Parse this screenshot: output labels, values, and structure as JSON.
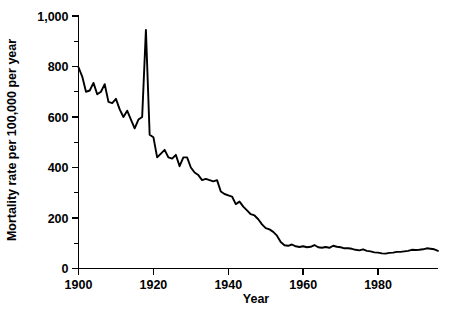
{
  "chart_data": {
    "type": "line",
    "title": "",
    "xlabel": "Year",
    "ylabel": "Mortality rate per 100,000 per year",
    "xlim": [
      1900,
      1996
    ],
    "ylim": [
      0,
      1000
    ],
    "grid": false,
    "legend": "none",
    "x_ticks": [
      1900,
      1920,
      1940,
      1960,
      1980
    ],
    "x_tick_labels": [
      "1900",
      "1920",
      "1940",
      "1960",
      "1980"
    ],
    "x_minor_ticks": [
      1910,
      1930,
      1950,
      1970,
      1990
    ],
    "y_ticks": [
      0,
      200,
      400,
      600,
      800,
      1000
    ],
    "y_tick_labels": [
      "0",
      "200",
      "400",
      "600",
      "800",
      "1,000"
    ],
    "y_minor_ticks": [
      100,
      300,
      500,
      700,
      900
    ],
    "line_color": "#000000",
    "series": [
      {
        "name": "Infectious disease mortality rate",
        "x": [
          1900,
          1901,
          1902,
          1903,
          1904,
          1905,
          1906,
          1907,
          1908,
          1909,
          1910,
          1911,
          1912,
          1913,
          1914,
          1915,
          1916,
          1917,
          1918,
          1919,
          1920,
          1921,
          1922,
          1923,
          1924,
          1925,
          1926,
          1927,
          1928,
          1929,
          1930,
          1931,
          1932,
          1933,
          1934,
          1935,
          1936,
          1937,
          1938,
          1939,
          1940,
          1941,
          1942,
          1943,
          1944,
          1945,
          1946,
          1947,
          1948,
          1949,
          1950,
          1951,
          1952,
          1953,
          1954,
          1955,
          1956,
          1957,
          1958,
          1959,
          1960,
          1961,
          1962,
          1963,
          1964,
          1965,
          1966,
          1967,
          1968,
          1969,
          1970,
          1971,
          1972,
          1973,
          1974,
          1975,
          1976,
          1977,
          1978,
          1979,
          1980,
          1981,
          1982,
          1983,
          1984,
          1985,
          1986,
          1987,
          1988,
          1989,
          1990,
          1991,
          1992,
          1993,
          1994,
          1995,
          1996
        ],
        "values": [
          797,
          760,
          700,
          705,
          735,
          690,
          700,
          730,
          660,
          655,
          672,
          630,
          600,
          625,
          590,
          555,
          590,
          600,
          945,
          530,
          520,
          440,
          455,
          470,
          440,
          435,
          450,
          405,
          440,
          440,
          400,
          380,
          370,
          350,
          355,
          350,
          345,
          350,
          305,
          295,
          290,
          285,
          255,
          265,
          245,
          230,
          215,
          210,
          195,
          175,
          160,
          155,
          145,
          130,
          105,
          92,
          90,
          95,
          88,
          85,
          88,
          84,
          86,
          93,
          84,
          82,
          85,
          82,
          90,
          86,
          84,
          80,
          80,
          78,
          74,
          72,
          76,
          70,
          68,
          64,
          63,
          60,
          59,
          62,
          63,
          66,
          66,
          68,
          70,
          74,
          73,
          74,
          76,
          80,
          78,
          76,
          70
        ]
      }
    ]
  }
}
